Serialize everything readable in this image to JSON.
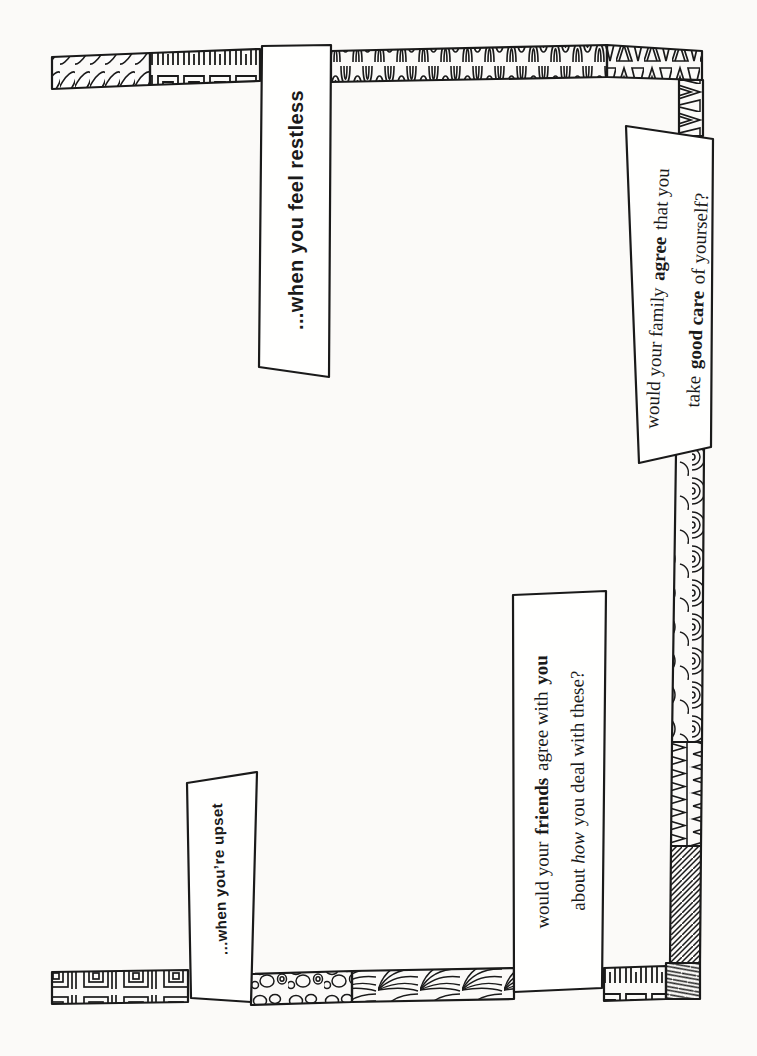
{
  "page": {
    "background": "#fbfaf8",
    "ink": "#1a1a1a",
    "paper": "#ffffff"
  },
  "banners": {
    "restless": "...when you feel restless",
    "upset": "...when you’re upset"
  },
  "questions": {
    "family": {
      "line1_pre": "would your family ",
      "line1_bold": "agree",
      "line1_post": " that you",
      "line2_pre": "take ",
      "line2_bold": "good care",
      "line2_post": " of yourself?"
    },
    "friends": {
      "line1_pre": "would your ",
      "line1_bold1": "friends",
      "line1_mid": " agree with ",
      "line1_bold2": "you",
      "line2_pre": "about ",
      "line2_italic": "how",
      "line2_post": " you deal with these?"
    }
  },
  "decorations": {
    "top_border": [
      "rope-doodle",
      "greek-key-doodle",
      "flame-wave-doodle",
      "triangle-doodle"
    ],
    "right_border": [
      "shell-arc-doodle",
      "zigzag-doodle",
      "diagonal-hatch-doodle"
    ],
    "bottom_border": [
      "greek-key-doodle",
      "fan-swirl-doodle",
      "pebble-doodle",
      "square-spiral-doodle"
    ]
  }
}
